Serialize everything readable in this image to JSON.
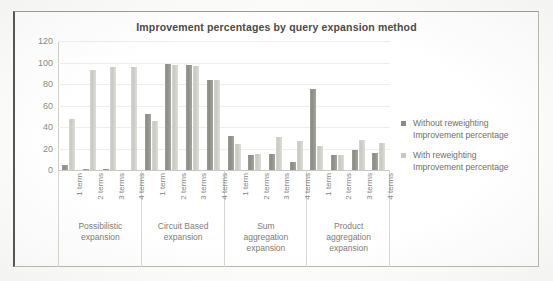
{
  "chart_data": {
    "type": "bar",
    "title": "Improvement percentages by query expansion method",
    "xlabel": "",
    "ylabel": "",
    "ylim": [
      0,
      120
    ],
    "yticks": [
      0,
      20,
      40,
      60,
      80,
      100,
      120
    ],
    "grid": true,
    "legend_position": "right",
    "categories": [
      "1 term",
      "2 terms",
      "3 terms",
      "4 terms"
    ],
    "groups": [
      "Possibilistic expansion",
      "Circuit Based expansion",
      "Sum aggregation expansion",
      "Product aggregation expansion"
    ],
    "group_label_lines": [
      [
        "Possibilistic",
        "expansion"
      ],
      [
        "Circuit Based",
        "expansion"
      ],
      [
        "Sum",
        "aggregation",
        "expansion"
      ],
      [
        "Product",
        "aggregation",
        "expansion"
      ]
    ],
    "series": [
      {
        "name": "Without reweighting Improvement percentage",
        "color": "#8c8c87",
        "values": [
          [
            5,
            1,
            1,
            0
          ],
          [
            52,
            99,
            98,
            84
          ],
          [
            32,
            14,
            15,
            7
          ],
          [
            75,
            14,
            19,
            16
          ]
        ]
      },
      {
        "name": "With reweighting Improvement percentage",
        "color": "#c9c9c4",
        "values": [
          [
            47,
            93,
            96,
            96
          ],
          [
            46,
            98,
            97,
            84
          ],
          [
            24,
            15,
            31,
            27
          ],
          [
            22,
            14,
            28,
            25
          ]
        ]
      }
    ],
    "legend": [
      {
        "line1": "Without reweighting",
        "line2": "Improvement percentage",
        "swatch": "#8c8c87"
      },
      {
        "line1": "With reweighting",
        "line2": "Improvement percentage",
        "swatch": "#c9c9c4"
      }
    ]
  }
}
